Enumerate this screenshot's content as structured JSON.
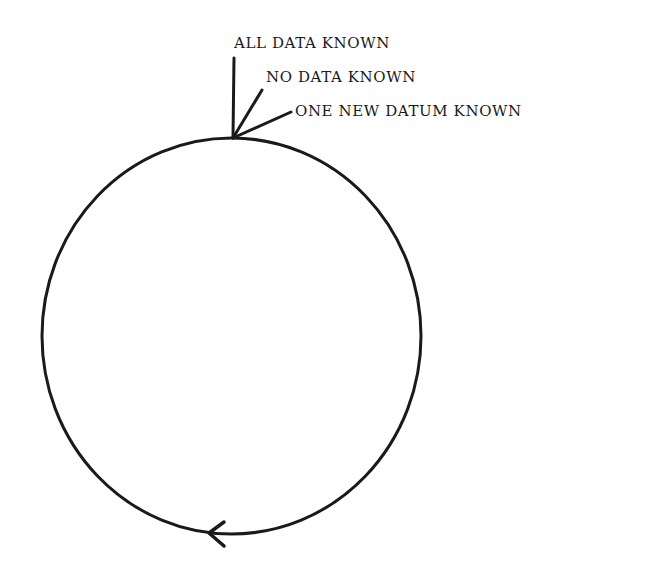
{
  "diagram": {
    "type": "cycle",
    "labels": {
      "all_data": "ALL DATA KNOWN",
      "no_data": "NO DATA KNOWN",
      "one_new": "ONE NEW DATUM KNOWN"
    },
    "direction": "counterclockwise",
    "stroke_color": "#1a1a1a",
    "background_color": "#ffffff"
  }
}
